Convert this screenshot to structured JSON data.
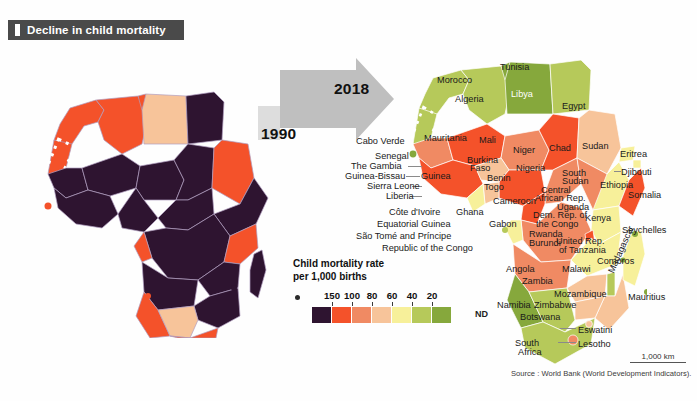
{
  "header": {
    "title": "Decline in child mortality",
    "bullet_icon": "square-bullet-icon"
  },
  "timeline": {
    "from_year": "1990",
    "to_year": "2018",
    "arrow_icon": "right-arrow-icon"
  },
  "legend": {
    "title_line1": "Child mortality rate",
    "title_line2": "per 1,000 births",
    "dot_icon": "legend-dot-icon",
    "ticks": [
      "150",
      "100",
      "80",
      "60",
      "40",
      "20"
    ],
    "no_data_label": "ND",
    "swatch_colors": [
      "#2e1430",
      "#f4522a",
      "#f08a63",
      "#f7c49a",
      "#f7f09a",
      "#b6c95a",
      "#86a83c"
    ],
    "nd_color": "#ffffff"
  },
  "scale": {
    "distance_label": "1,000 km"
  },
  "source": {
    "text": "Source : World Bank (World Development Indicators)."
  },
  "chart_data": {
    "type": "map",
    "title": "Decline in child mortality",
    "unit": "child mortality rate per 1,000 births",
    "panels": [
      {
        "year": "1990",
        "name": "africa-1990"
      },
      {
        "year": "2018",
        "name": "africa-2018"
      }
    ],
    "legend_breaks": [
      150,
      100,
      80,
      60,
      40,
      20
    ],
    "legend_colors": [
      "#2e1430",
      "#f4522a",
      "#f08a63",
      "#f7c49a",
      "#f7f09a",
      "#b6c95a",
      "#86a83c"
    ]
  },
  "labels_2018": [
    {
      "text": "Morocco",
      "x": 437,
      "y": 76,
      "color": "dark"
    },
    {
      "text": "Algeria",
      "x": 455,
      "y": 95,
      "color": "dark"
    },
    {
      "text": "Tunisia",
      "x": 500,
      "y": 63,
      "color": "dark"
    },
    {
      "text": "Libya",
      "x": 511,
      "y": 90,
      "color": "light"
    },
    {
      "text": "Egypt",
      "x": 562,
      "y": 102,
      "color": "dark"
    },
    {
      "text": "Cabo Verde",
      "x": 356,
      "y": 137,
      "color": "dark"
    },
    {
      "text": "Mauritania",
      "x": 424,
      "y": 134,
      "color": "dark"
    },
    {
      "text": "Mali",
      "x": 479,
      "y": 136,
      "color": "dark"
    },
    {
      "text": "Niger",
      "x": 513,
      "y": 146,
      "color": "dark"
    },
    {
      "text": "Chad",
      "x": 549,
      "y": 144,
      "color": "dark"
    },
    {
      "text": "Sudan",
      "x": 582,
      "y": 142,
      "color": "dark"
    },
    {
      "text": "Eritrea",
      "x": 620,
      "y": 150,
      "color": "dark"
    },
    {
      "text": "Senegal",
      "x": 375,
      "y": 152,
      "color": "dark"
    },
    {
      "text": "Burkina",
      "x": 467,
      "y": 156,
      "color": "dark"
    },
    {
      "text": "Faso",
      "x": 470,
      "y": 164,
      "color": "dark"
    },
    {
      "text": "Nigeria",
      "x": 516,
      "y": 164,
      "color": "dark"
    },
    {
      "text": "Djibouti",
      "x": 621,
      "y": 168,
      "color": "dark"
    },
    {
      "text": "The Gambia",
      "x": 351,
      "y": 162,
      "color": "dark"
    },
    {
      "text": "Guinea-Bissau",
      "x": 345,
      "y": 172,
      "color": "dark"
    },
    {
      "text": "Guinea",
      "x": 421,
      "y": 172,
      "color": "dark"
    },
    {
      "text": "Benin",
      "x": 487,
      "y": 174,
      "color": "dark"
    },
    {
      "text": "South",
      "x": 562,
      "y": 169,
      "color": "dark"
    },
    {
      "text": "Sudan",
      "x": 562,
      "y": 177,
      "color": "dark"
    },
    {
      "text": "Ethiopia",
      "x": 600,
      "y": 181,
      "color": "dark"
    },
    {
      "text": "Somalia",
      "x": 628,
      "y": 191,
      "color": "dark"
    },
    {
      "text": "Sierra Leone",
      "x": 367,
      "y": 182,
      "color": "dark"
    },
    {
      "text": "Togo",
      "x": 484,
      "y": 183,
      "color": "dark"
    },
    {
      "text": "Central",
      "x": 541,
      "y": 186,
      "color": "dark"
    },
    {
      "text": "African Rep.",
      "x": 535,
      "y": 194,
      "color": "dark"
    },
    {
      "text": "Cameroon",
      "x": 493,
      "y": 197,
      "color": "dark"
    },
    {
      "text": "Liberia",
      "x": 386,
      "y": 192,
      "color": "dark"
    },
    {
      "text": "Uganda",
      "x": 557,
      "y": 203,
      "color": "dark"
    },
    {
      "text": "Côte d'Ivoire",
      "x": 389,
      "y": 208,
      "color": "dark"
    },
    {
      "text": "Ghana",
      "x": 456,
      "y": 208,
      "color": "dark"
    },
    {
      "text": "Dem. Rep. of",
      "x": 533,
      "y": 211,
      "color": "dark"
    },
    {
      "text": "Kenya",
      "x": 585,
      "y": 214,
      "color": "dark"
    },
    {
      "text": "Equatorial Guinea",
      "x": 377,
      "y": 220,
      "color": "dark"
    },
    {
      "text": "Gabon",
      "x": 489,
      "y": 220,
      "color": "dark"
    },
    {
      "text": "the Congo",
      "x": 536,
      "y": 220,
      "color": "dark"
    },
    {
      "text": "Seychelles",
      "x": 622,
      "y": 226,
      "color": "dark"
    },
    {
      "text": "São Tomé and Príncipe",
      "x": 356,
      "y": 232,
      "color": "dark"
    },
    {
      "text": "Rwanda",
      "x": 529,
      "y": 230,
      "color": "dark"
    },
    {
      "text": "Burundi",
      "x": 529,
      "y": 239,
      "color": "dark"
    },
    {
      "text": "United Rep.",
      "x": 556,
      "y": 237,
      "color": "dark"
    },
    {
      "text": "Republic of the Congo",
      "x": 382,
      "y": 244,
      "color": "dark"
    },
    {
      "text": "of Tanzania",
      "x": 559,
      "y": 246,
      "color": "dark"
    },
    {
      "text": "Comoros",
      "x": 597,
      "y": 257,
      "color": "dark"
    },
    {
      "text": "Angola",
      "x": 506,
      "y": 265,
      "color": "dark"
    },
    {
      "text": "Malawi",
      "x": 562,
      "y": 265,
      "color": "dark"
    },
    {
      "text": "Zambia",
      "x": 522,
      "y": 277,
      "color": "dark"
    },
    {
      "text": "Mauritius",
      "x": 628,
      "y": 293,
      "color": "dark"
    },
    {
      "text": "Mozambique",
      "x": 554,
      "y": 290,
      "color": "dark"
    },
    {
      "text": "Zimbabwe",
      "x": 534,
      "y": 301,
      "color": "dark"
    },
    {
      "text": "Namibia",
      "x": 497,
      "y": 301,
      "color": "dark"
    },
    {
      "text": "Madagascar",
      "x": 607,
      "y": 271,
      "color": "dark",
      "rotated": true
    },
    {
      "text": "Botswana",
      "x": 520,
      "y": 313,
      "color": "dark"
    },
    {
      "text": "Eswatini",
      "x": 578,
      "y": 326,
      "color": "dark"
    },
    {
      "text": "Lesotho",
      "x": 578,
      "y": 340,
      "color": "dark"
    },
    {
      "text": "South",
      "x": 515,
      "y": 339,
      "color": "dark"
    },
    {
      "text": "Africa",
      "x": 518,
      "y": 348,
      "color": "dark"
    }
  ]
}
